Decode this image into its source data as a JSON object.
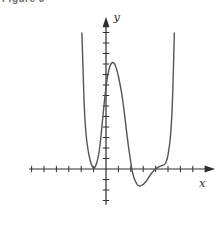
{
  "figure": {
    "caption": "Figure 3"
  },
  "colors": {
    "background": "#ffffff",
    "axis": "#2e2e2e",
    "curve": "#555555",
    "label": "#2e2e2e",
    "caption": "#6f6f6f"
  },
  "chart_data": {
    "type": "line",
    "title": "",
    "xlabel": "x",
    "ylabel": "y",
    "grid": false,
    "legend_position": null,
    "x_axis": {
      "min": -6.2,
      "max": 8.8,
      "tick_step": 1,
      "ticks": [
        -6,
        -5,
        -4,
        -3,
        -2,
        -1,
        1,
        2,
        3,
        4,
        5,
        6,
        7
      ]
    },
    "y_axis": {
      "min": -3.4,
      "max": 14.5,
      "tick_step": 1,
      "ticks": [
        -3,
        -2,
        -1,
        1,
        2,
        3,
        4,
        5,
        6,
        7,
        8,
        9,
        10,
        11,
        12,
        13
      ]
    },
    "series": [
      {
        "name": "f(x)",
        "points": [
          [
            -1.94,
            12.95
          ],
          [
            -1.85,
            9.5
          ],
          [
            -1.77,
            6.1
          ],
          [
            -1.63,
            3.43
          ],
          [
            -1.45,
            1.71
          ],
          [
            -1.25,
            0.67
          ],
          [
            -1.1,
            0.2
          ],
          [
            -0.95,
            0.02
          ],
          [
            -0.8,
            0.38
          ],
          [
            -0.65,
            0.95
          ],
          [
            -0.48,
            2.2
          ],
          [
            -0.32,
            4.1
          ],
          [
            -0.16,
            6.1
          ],
          [
            0.0,
            7.9
          ],
          [
            0.16,
            9.1
          ],
          [
            0.32,
            9.86
          ],
          [
            0.52,
            10.19
          ],
          [
            0.72,
            10.02
          ],
          [
            0.93,
            9.24
          ],
          [
            1.13,
            8.1
          ],
          [
            1.33,
            6.76
          ],
          [
            1.53,
            4.9
          ],
          [
            1.73,
            2.86
          ],
          [
            1.9,
            1.4
          ],
          [
            2.06,
            0.1
          ],
          [
            2.22,
            -0.75
          ],
          [
            2.38,
            -1.22
          ],
          [
            2.55,
            -1.55
          ],
          [
            2.73,
            -1.64
          ],
          [
            2.92,
            -1.53
          ],
          [
            3.1,
            -1.39
          ],
          [
            3.32,
            -1.05
          ],
          [
            3.55,
            -0.6
          ],
          [
            3.78,
            -0.25
          ],
          [
            3.99,
            0.01
          ],
          [
            4.17,
            0.16
          ],
          [
            4.35,
            0.26
          ],
          [
            4.55,
            0.34
          ],
          [
            4.72,
            0.4
          ],
          [
            4.88,
            0.75
          ],
          [
            5.0,
            1.29
          ],
          [
            5.12,
            2.2
          ],
          [
            5.23,
            3.52
          ],
          [
            5.33,
            5.5
          ],
          [
            5.4,
            7.9
          ],
          [
            5.46,
            10.4
          ],
          [
            5.51,
            12.95
          ]
        ]
      }
    ]
  }
}
